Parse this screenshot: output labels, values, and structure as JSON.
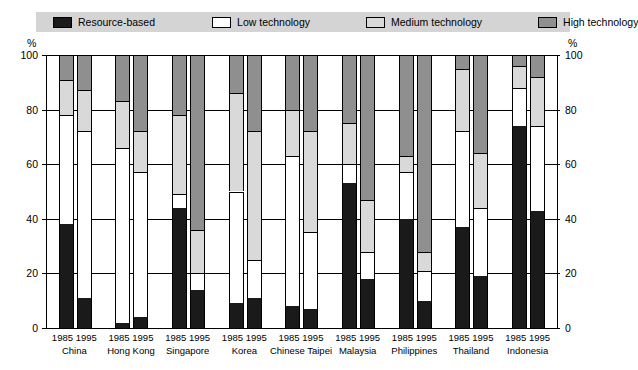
{
  "legend": {
    "items": [
      {
        "label": "Resource-based",
        "color": "#1a1a1a",
        "swatch": "resource-swatch"
      },
      {
        "label": "Low technology",
        "color": "#ffffff",
        "swatch": "low-swatch"
      },
      {
        "label": "Medium technology",
        "color": "#d9d9d9",
        "swatch": "medium-swatch"
      },
      {
        "label": "High technology",
        "color": "#8f8f8f",
        "swatch": "high-swatch"
      }
    ],
    "background": "#d4d4d4"
  },
  "axis": {
    "unit_left": "%",
    "unit_right": "%",
    "ticks": [
      100,
      80,
      60,
      40,
      20,
      0
    ],
    "min": 0,
    "max": 100
  },
  "chart_data": {
    "type": "bar",
    "stacked": true,
    "title": "",
    "subtitle": "",
    "xlabel": "",
    "ylabel": "%",
    "ylim": [
      0,
      100
    ],
    "grid": true,
    "legend_position": "top",
    "series": [
      {
        "name": "Resource-based",
        "color": "#1a1a1a"
      },
      {
        "name": "Low technology",
        "color": "#ffffff"
      },
      {
        "name": "Medium technology",
        "color": "#d9d9d9"
      },
      {
        "name": "High technology",
        "color": "#8f8f8f"
      }
    ],
    "categories": [
      "China",
      "Hong Kong",
      "Singapore",
      "Korea",
      "Chinese Taipei",
      "Malaysia",
      "Philippines",
      "Thailand",
      "Indonesia"
    ],
    "years": [
      "1985",
      "1995"
    ],
    "groups": [
      {
        "country": "China",
        "bars": [
          {
            "year": "1985",
            "values": {
              "resource": 38,
              "low": 40,
              "medium": 13,
              "high": 9
            }
          },
          {
            "year": "1995",
            "values": {
              "resource": 11,
              "low": 61,
              "medium": 15,
              "high": 13
            }
          }
        ]
      },
      {
        "country": "Hong Kong",
        "bars": [
          {
            "year": "1985",
            "values": {
              "resource": 2,
              "low": 64,
              "medium": 17,
              "high": 17
            }
          },
          {
            "year": "1995",
            "values": {
              "resource": 4,
              "low": 53,
              "medium": 15,
              "high": 28
            }
          }
        ]
      },
      {
        "country": "Singapore",
        "bars": [
          {
            "year": "1985",
            "values": {
              "resource": 44,
              "low": 5,
              "medium": 29,
              "high": 22
            }
          },
          {
            "year": "1995",
            "values": {
              "resource": 14,
              "low": 6,
              "medium": 16,
              "high": 64
            }
          }
        ]
      },
      {
        "country": "Korea",
        "bars": [
          {
            "year": "1985",
            "values": {
              "resource": 9,
              "low": 41,
              "medium": 36,
              "high": 14
            }
          },
          {
            "year": "1995",
            "values": {
              "resource": 11,
              "low": 14,
              "medium": 47,
              "high": 28
            }
          }
        ]
      },
      {
        "country": "Chinese Taipei",
        "bars": [
          {
            "year": "1985",
            "values": {
              "resource": 8,
              "low": 55,
              "medium": 17,
              "high": 20
            }
          },
          {
            "year": "1995",
            "values": {
              "resource": 7,
              "low": 28,
              "medium": 37,
              "high": 28
            }
          }
        ]
      },
      {
        "country": "Malaysia",
        "bars": [
          {
            "year": "1985",
            "values": {
              "resource": 53,
              "low": 7,
              "medium": 15,
              "high": 25
            }
          },
          {
            "year": "1995",
            "values": {
              "resource": 18,
              "low": 10,
              "medium": 19,
              "high": 53
            }
          }
        ]
      },
      {
        "country": "Philippines",
        "bars": [
          {
            "year": "1985",
            "values": {
              "resource": 40,
              "low": 17,
              "medium": 6,
              "high": 37
            }
          },
          {
            "year": "1995",
            "values": {
              "resource": 10,
              "low": 11,
              "medium": 7,
              "high": 72
            }
          }
        ]
      },
      {
        "country": "Thailand",
        "bars": [
          {
            "year": "1985",
            "values": {
              "resource": 37,
              "low": 35,
              "medium": 23,
              "high": 5
            }
          },
          {
            "year": "1995",
            "values": {
              "resource": 19,
              "low": 25,
              "medium": 20,
              "high": 36
            }
          }
        ]
      },
      {
        "country": "Indonesia",
        "bars": [
          {
            "year": "1985",
            "values": {
              "resource": 74,
              "low": 14,
              "medium": 8,
              "high": 4
            }
          },
          {
            "year": "1995",
            "values": {
              "resource": 43,
              "low": 31,
              "medium": 18,
              "high": 8
            }
          }
        ]
      }
    ]
  }
}
